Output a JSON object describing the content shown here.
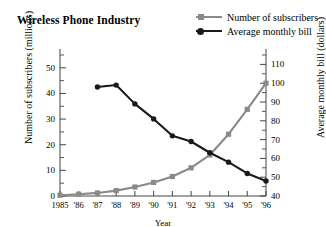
{
  "title": "Wireless Phone Industry",
  "legend": [
    {
      "label": "Number of subscribers",
      "color": "#8a8a8a",
      "marker": "square"
    },
    {
      "label": "Average monthly bill",
      "color": "#1a1a1a",
      "marker": "circle"
    }
  ],
  "axes": {
    "x_title": "Year",
    "y_left_title": "Number of subscribers (millions)",
    "y_right_title": "Average monthly bill (dollars)"
  },
  "chart_data": {
    "type": "line",
    "title": "Wireless Phone Industry",
    "xlabel": "Year",
    "ylabel": "Number of subscribers (millions)",
    "y2label": "Average monthly bill (dollars)",
    "grid": false,
    "legend_position": "top-right",
    "x": [
      "1985",
      "'86",
      "'87",
      "'88",
      "'89",
      "'90",
      "'91",
      "'92",
      "'93",
      "'94",
      "'95",
      "'96"
    ],
    "xticklabels": [
      "1985",
      "'86",
      "'87",
      "'88",
      "'89",
      "'90",
      "'91",
      "'92",
      "'93",
      "'94",
      "'95",
      "'96"
    ],
    "yticklabels_left": [
      "0",
      "10",
      "20",
      "30",
      "40",
      "50"
    ],
    "ytickvalues_left": [
      0,
      10,
      20,
      30,
      40,
      50
    ],
    "ylim": [
      0,
      55
    ],
    "yminor_left": [
      5,
      15,
      25,
      35,
      45,
      55
    ],
    "yticklabels_right": [
      "40",
      "50",
      "60",
      "70",
      "80",
      "90",
      "100",
      "110"
    ],
    "ytickvalues_right": [
      40,
      50,
      60,
      70,
      80,
      90,
      100,
      110
    ],
    "y2lim": [
      40,
      115
    ],
    "yminor_right": [
      45,
      55,
      65,
      75,
      85,
      95,
      105,
      115
    ],
    "series": [
      {
        "name": "Number of subscribers",
        "axis": "left",
        "color": "#8a8a8a",
        "marker": "square",
        "units": "millions",
        "x": [
          "1985",
          "'86",
          "'87",
          "'88",
          "'89",
          "'90",
          "'91",
          "'92",
          "'93",
          "'94",
          "'95",
          "'96"
        ],
        "values": [
          0.3,
          0.7,
          1.2,
          2.1,
          3.5,
          5.3,
          7.6,
          11.0,
          16.0,
          24.1,
          33.8,
          44.0
        ]
      },
      {
        "name": "Average monthly bill",
        "axis": "right",
        "color": "#1a1a1a",
        "marker": "circle",
        "units": "dollars",
        "x": [
          "'87",
          "'88",
          "'89",
          "'90",
          "'91",
          "'92",
          "'93",
          "'94",
          "'95",
          "'96"
        ],
        "values": [
          98,
          99,
          89,
          81,
          72,
          69,
          63,
          58,
          52,
          48
        ]
      }
    ]
  }
}
